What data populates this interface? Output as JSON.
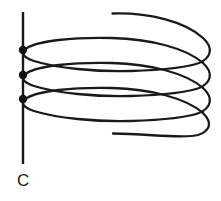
{
  "figure": {
    "kind": "line-diagram",
    "background_color": "#ffffff",
    "width": 221,
    "height": 201
  },
  "axis": {
    "label": "C",
    "label_x": 17,
    "label_y": 186,
    "color": "#1a1a1a",
    "stroke_width": 2.4,
    "x": 23,
    "y_top": 12,
    "y_bottom": 164
  },
  "nodes": {
    "color": "#111111",
    "radius": 4.2,
    "points": [
      {
        "name": "node-top",
        "x": 23,
        "y": 50
      },
      {
        "name": "node-middle",
        "x": 23,
        "y": 75
      },
      {
        "name": "node-bottom",
        "x": 23,
        "y": 99
      }
    ]
  },
  "coil": {
    "color": "#1a1a1a",
    "stroke_width": 2.3,
    "turns": 3,
    "right_extent": 212,
    "top_lead": {
      "x": 112,
      "y": 13
    },
    "bottom_lead": {
      "x": 113,
      "y": 133
    },
    "segments": [
      {
        "name": "coil-turn-1",
        "d": "M 112.5 13.5 C 150 12.5 186 22 203 38 C 214 48 211 58 199 63 C 186 68 160 70 131 71 C 96 72 56 68 34 61 C 22 57 20 52 27 48 C 38 41 72 37 112 38 C 150 39 186 48 203 63"
      },
      {
        "name": "coil-turn-2",
        "d": "M 203 63 C 214 73 211 83 199 88 C 186 93 160 95 131 96 C 96 97 56 93 34 86 C 22 82 20 77 27 73 C 38 66 72 62 112 63 C 150 64 186 73 203 88"
      },
      {
        "name": "coil-turn-3",
        "d": "M 203 88 C 214 98 211 108 199 113 C 186 118 160 120 131 121 C 96 122 56 118 34 111 C 22 107 20 102 27 98 C 38 91 72 87 112 88 C 150 89 186 98 203 113"
      },
      {
        "name": "coil-tail",
        "d": "M 203 113 C 213 123 210 131 198 135 C 184 139 150 134 113 133.5"
      }
    ]
  }
}
